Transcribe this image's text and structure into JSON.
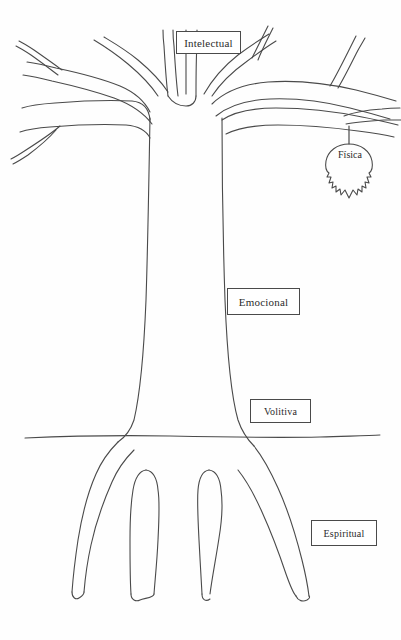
{
  "diagram": {
    "background_color": "#fefefe",
    "stroke_color": "#4a4a4a",
    "text_color": "#2b2b2b",
    "ground_line_y": 437
  },
  "labels": {
    "intelectual": "Intelectual",
    "emocional": "Emocional",
    "volitiva": "Volitiva",
    "espiritual": "Espiritual",
    "fisica": "Física"
  },
  "parts": {
    "crown_name": "branches-crown",
    "trunk_name": "trunk",
    "roots_name": "roots",
    "leaf_name": "leaf-fisica",
    "ground_name": "ground-line"
  }
}
